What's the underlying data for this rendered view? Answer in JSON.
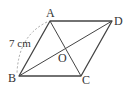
{
  "diagram": {
    "type": "rhombus",
    "vertices": {
      "A": {
        "label": "A",
        "x": 50,
        "y": 21
      },
      "B": {
        "label": "B",
        "x": 19,
        "y": 76
      },
      "C": {
        "label": "C",
        "x": 81,
        "y": 76
      },
      "D": {
        "label": "D",
        "x": 112,
        "y": 21
      },
      "O": {
        "label": "O",
        "x": 65,
        "y": 49
      }
    },
    "side_label": "7 cm",
    "colors": {
      "line": "#444444",
      "dashed_arc": "#999999",
      "text": "#333333"
    }
  }
}
